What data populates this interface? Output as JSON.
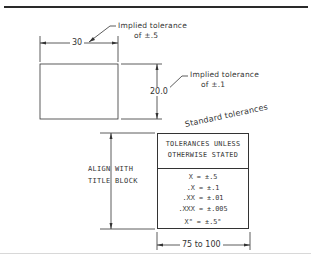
{
  "figure": {
    "title": "Standard tolerances",
    "part_drawing": {
      "width_dimension": "30",
      "height_dimension": "20.0",
      "callouts": [
        {
          "line1": "Implied tolerance",
          "line2": "of ±.5"
        },
        {
          "line1": "Implied tolerance",
          "line2": "of ±.1"
        }
      ]
    },
    "tolerance_block": {
      "header_line1": "TOLERANCES UNLESS",
      "header_line2": "OTHERWISE STATED",
      "rows": [
        "X = ±.5",
        ".X = ±.1",
        ".XX = ±.01",
        ".XXX = ±.005",
        "X° = ±.5°"
      ],
      "width_dimension": "75 to 100",
      "side_note_line1": "ALIGN WITH",
      "side_note_line2": "TITLE BLOCK"
    }
  },
  "colors": {
    "line": "#333333",
    "background": "#ffffff",
    "bottom_rule": "#d8d8d8"
  }
}
